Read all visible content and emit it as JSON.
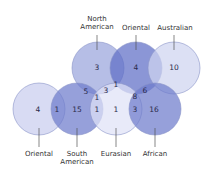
{
  "diagram": {
    "type": "venn",
    "sets": [
      {
        "id": "oriental_left",
        "label": "Oriental",
        "color": "#c9cdee"
      },
      {
        "id": "south_american",
        "label": "South American",
        "color": "#6d7ccc"
      },
      {
        "id": "north_american",
        "label": "North American",
        "color": "#9aa5dd"
      },
      {
        "id": "eurasian",
        "label": "Eurasian",
        "color": "#dfe2f6"
      },
      {
        "id": "oriental_top",
        "label": "Oriental",
        "color": "#5e6ec6"
      },
      {
        "id": "australian",
        "label": "Australian",
        "color": "#cfd4f0"
      },
      {
        "id": "african",
        "label": "African",
        "color": "#6d7ccc"
      }
    ],
    "labels": {
      "north_american_1": "North",
      "north_american_2": "American",
      "oriental_top": "Oriental",
      "australian": "Australian",
      "oriental_left": "Oriental",
      "south_american_1": "South",
      "south_american_2": "American",
      "eurasian": "Eurasian",
      "african": "African"
    },
    "regions": {
      "oriental_left_only": "4",
      "oriental_left_south_american": "1",
      "south_american_only": "15",
      "north_american_only": "3",
      "north_american_south_american": "5",
      "north_south_eurasian": "1",
      "north_american_eurasian": "3",
      "north_eurasian_oriental": "1",
      "south_american_eurasian": "1",
      "eurasian_only": "1",
      "oriental_top_only": "4",
      "australian_only": "10",
      "oriental_australian_african": "6",
      "oriental_eurasian_african": "8",
      "eurasian_african": "3",
      "african_only": "16"
    }
  }
}
